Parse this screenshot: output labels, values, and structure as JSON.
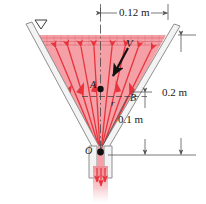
{
  "figure": {
    "type": "fluid-mechanics-diagram",
    "colors": {
      "fluid_fill": "#f4a0a6",
      "streamline": "#e8323c",
      "wall": "#8c8c8c",
      "wall_fill": "#f2f2f2",
      "dimension": "#555555",
      "label": "#1a1a1a",
      "vector": "#111111",
      "jet": "#f08b92"
    }
  },
  "dimensions": [
    {
      "id": "top-width",
      "label": "0.12 m",
      "orientation": "horizontal"
    },
    {
      "id": "total-depth",
      "label": "0.2 m",
      "orientation": "vertical"
    },
    {
      "id": "b-depth",
      "label": "0.1 m",
      "orientation": "vertical"
    }
  ],
  "points": [
    {
      "id": "A",
      "label": "A"
    },
    {
      "id": "B",
      "label": "B"
    },
    {
      "id": "O",
      "label": "O"
    }
  ],
  "annotations": [
    {
      "id": "velocity",
      "label": "V",
      "kind": "vector"
    },
    {
      "id": "radius",
      "label": "r",
      "kind": "radial-distance"
    }
  ],
  "icons": {
    "free_surface": "water-level-triangle-icon"
  }
}
